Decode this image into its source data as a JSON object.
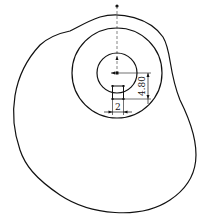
{
  "diagram": {
    "type": "cad-sketch",
    "colors": {
      "line": "#111111",
      "background": "#ffffff"
    },
    "dimensions": {
      "vertical_offset": "4.80",
      "square_width": "2"
    },
    "elements": [
      "outer-profile",
      "large-circle",
      "small-circle",
      "center-point",
      "top-point",
      "vertical-construction-line",
      "small-square",
      "vertical-dimension",
      "horizontal-dimension"
    ]
  }
}
